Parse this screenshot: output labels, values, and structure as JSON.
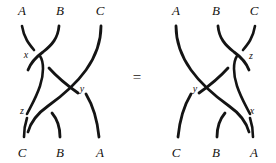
{
  "figure": {
    "kind": "braid-relation-diagram",
    "background_color": "#ffffff",
    "stroke_color": "#141414",
    "text_color": "#15120f",
    "relation_symbol": "=",
    "left_braid": {
      "top_labels": [
        "A",
        "B",
        "C"
      ],
      "bottom_labels": [
        "C",
        "B",
        "A"
      ],
      "crossing_labels": [
        "x",
        "y",
        "z"
      ],
      "crossings": [
        {
          "label": "x",
          "label_x": 26,
          "label_y": 56
        },
        {
          "label": "y",
          "label_x": 81,
          "label_y": 90
        },
        {
          "label": "z",
          "label_x": 22,
          "label_y": 111
        }
      ]
    },
    "right_braid": {
      "top_labels": [
        "A",
        "B",
        "C"
      ],
      "bottom_labels": [
        "C",
        "B",
        "A"
      ],
      "crossing_labels": [
        "z",
        "y",
        "x"
      ],
      "crossings": [
        {
          "label": "z",
          "label_x": 240,
          "label_y": 57
        },
        {
          "label": "y",
          "label_x": 180,
          "label_y": 90
        },
        {
          "label": "x",
          "label_x": 240,
          "label_y": 112
        }
      ]
    }
  },
  "left_top": {
    "a": "A",
    "b": "B",
    "c": "C"
  },
  "left_bottom": {
    "a": "C",
    "b": "B",
    "c": "A"
  },
  "left_cross": {
    "x": "x",
    "y": "y",
    "z": "z"
  },
  "right_top": {
    "a": "A",
    "b": "B",
    "c": "C"
  },
  "right_bottom": {
    "a": "C",
    "b": "B",
    "c": "A"
  },
  "right_cross": {
    "z": "z",
    "y": "y",
    "x": "x"
  },
  "equals": {
    "symbol": "="
  }
}
